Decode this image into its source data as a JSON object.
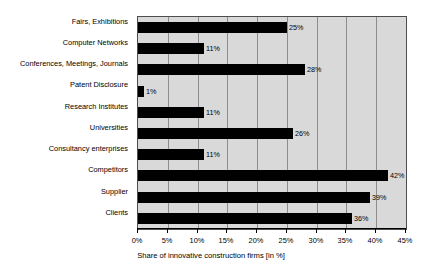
{
  "chart_data": {
    "type": "bar",
    "orientation": "horizontal",
    "title": "",
    "xlabel": "Share of innovative construction firms [in %]",
    "ylabel": "",
    "xlim": [
      0,
      45
    ],
    "xticks": [
      "0%",
      "5%",
      "10%",
      "15%",
      "20%",
      "25%",
      "30%",
      "35%",
      "40%",
      "45%"
    ],
    "xtick_values": [
      0,
      5,
      10,
      15,
      20,
      25,
      30,
      35,
      40,
      45
    ],
    "grid": true,
    "grid_axis": "x",
    "legend": false,
    "categories": [
      "Fairs, Exhibitions",
      "Computer Networks",
      "Conferences, Meetings, Journals",
      "Patent Disclosure",
      "Research Institutes",
      "Universities",
      "Consultancy enterprises",
      "Competitors",
      "Supplier",
      "Clients"
    ],
    "values": [
      25,
      11,
      28,
      1,
      11,
      26,
      11,
      42,
      39,
      36
    ],
    "data_labels": [
      "25%",
      "11%",
      "28%",
      "1%",
      "11%",
      "26%",
      "11%",
      "42%",
      "39%",
      "36%"
    ],
    "colors": {
      "bar": "#000000",
      "plot_background": "#d9d9d9",
      "page_background": "#ffffff",
      "gridline": "#8c8c8c",
      "axis": "#000000",
      "text": "#000000"
    }
  }
}
